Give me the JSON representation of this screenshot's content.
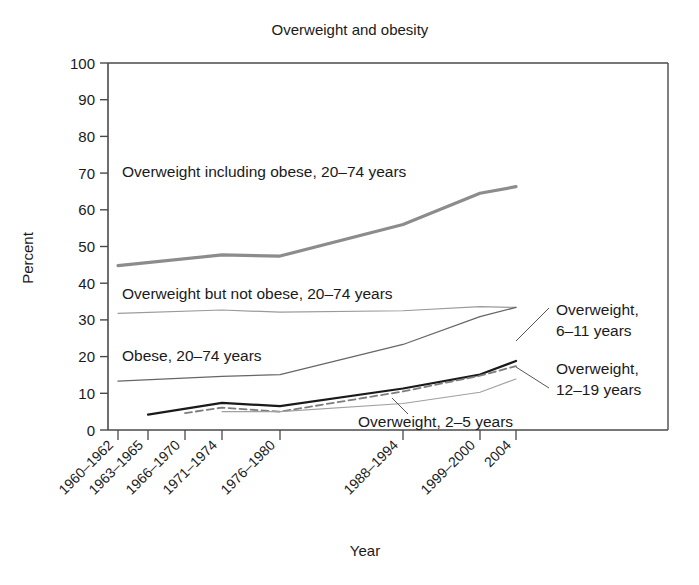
{
  "chart_data": {
    "type": "line",
    "title": "Overweight and obesity",
    "xlabel": "Year",
    "ylabel": "Percent",
    "ylim": [
      0,
      100
    ],
    "yticks": [
      "0",
      "10",
      "20",
      "30",
      "40",
      "50",
      "60",
      "70",
      "80",
      "90",
      "100"
    ],
    "categories": [
      "1960–1962",
      "1963–1965",
      "1966–1970",
      "1971–1974",
      "1976–1980",
      "1988–1994",
      "1999–2000",
      "2004"
    ],
    "grid": false,
    "legend_position": "inline-annotations",
    "series": [
      {
        "name": "Overweight including obese, 20–74 years",
        "style": "thick-gray",
        "color": "#8c8c8c",
        "x": [
          "1960–1962",
          "1971–1974",
          "1976–1980",
          "1988–1994",
          "1999–2000",
          "2004"
        ],
        "values": [
          44.8,
          47.7,
          47.4,
          56.0,
          64.5,
          66.3
        ]
      },
      {
        "name": "Overweight but not obese, 20–74 years",
        "style": "thin-gray",
        "color": "#9a9a9a",
        "x": [
          "1960–1962",
          "1971–1974",
          "1976–1980",
          "1988–1994",
          "1999–2000",
          "2004"
        ],
        "values": [
          31.8,
          32.7,
          32.1,
          32.5,
          33.6,
          33.4
        ]
      },
      {
        "name": "Obese, 20–74 years",
        "style": "thin-dark",
        "color": "#666666",
        "x": [
          "1960–1962",
          "1971–1974",
          "1976–1980",
          "1988–1994",
          "1999–2000",
          "2004"
        ],
        "values": [
          13.3,
          14.6,
          15.1,
          23.3,
          30.9,
          33.4
        ]
      },
      {
        "name": "Overweight, 6–11 years",
        "style": "solid-black",
        "color": "#1a1a1a",
        "x": [
          "1963–1965",
          "1971–1974",
          "1976–1980",
          "1988–1994",
          "1999–2000",
          "2004"
        ],
        "values": [
          4.2,
          7.4,
          6.5,
          11.3,
          15.1,
          18.8
        ]
      },
      {
        "name": "Overweight, 12–19 years",
        "style": "dashed-gray",
        "color": "#7d7d7d",
        "x": [
          "1966–1970",
          "1971–1974",
          "1976–1980",
          "1988–1994",
          "1999–2000",
          "2004"
        ],
        "values": [
          4.6,
          6.1,
          5.0,
          10.5,
          14.8,
          17.4
        ]
      },
      {
        "name": "Overweight, 2–5 years",
        "style": "thin-light",
        "color": "#a0a0a0",
        "x": [
          "1971–1974",
          "1976–1980",
          "1988–1994",
          "1999–2000",
          "2004"
        ],
        "values": [
          5.0,
          5.0,
          7.2,
          10.3,
          13.9
        ]
      }
    ],
    "annotations": [
      {
        "text": "Overweight including obese, 20–74 years",
        "x": 122,
        "y": 177
      },
      {
        "text": "Overweight but not obese, 20–74 years",
        "x": 122,
        "y": 299
      },
      {
        "text": "Obese, 20–74 years",
        "x": 122,
        "y": 361
      },
      {
        "text": "Overweight, 2–5 years",
        "x": 358,
        "y": 427
      },
      {
        "text": "Overweight,",
        "x": 556,
        "y": 315
      },
      {
        "text": "6–11 years",
        "x": 556,
        "y": 336
      },
      {
        "text": "Overweight,",
        "x": 556,
        "y": 374
      },
      {
        "text": "12–19 years",
        "x": 556,
        "y": 395
      }
    ]
  }
}
